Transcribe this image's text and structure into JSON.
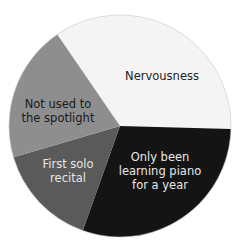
{
  "chart_data": {
    "type": "pie",
    "title": "",
    "center": [
      120,
      126
    ],
    "radius": 111,
    "start_angle_deg_clockwise_from_top": 325.6,
    "slices": [
      {
        "label": "Nervousness",
        "lines": [
          "Nervousness"
        ],
        "value": 35,
        "color": "#f4f4f4",
        "text_color": "#222222",
        "label_pos": [
          162,
          76
        ]
      },
      {
        "label": "Only been learning piano for a year",
        "lines": [
          "Only been",
          "learning piano",
          "for a year"
        ],
        "value": 30,
        "color": "#141414",
        "text_color": "#e8e8e8",
        "label_pos": [
          160,
          171
        ]
      },
      {
        "label": "First solo recital",
        "lines": [
          "First solo",
          "recital"
        ],
        "value": 15,
        "color": "#5a5a5a",
        "text_color": "#e6e6e6",
        "label_pos": [
          68,
          171
        ]
      },
      {
        "label": "Not used to the spotlight",
        "lines": [
          "Not used to",
          "the spotlight"
        ],
        "value": 20,
        "color": "#8e8e8e",
        "text_color": "#1a1a1a",
        "label_pos": [
          58,
          111
        ]
      }
    ],
    "legend": null,
    "outline_color": "#c8c8c8"
  }
}
